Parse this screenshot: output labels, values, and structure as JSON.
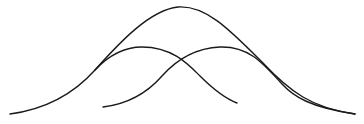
{
  "diagram": {
    "type": "overlapping-bell-curves",
    "stroke_color": "#1a1a1a",
    "background": "#ffffff",
    "curves": [
      {
        "name": "envelope",
        "peak": [
          180,
          7
        ],
        "start": [
          10,
          114
        ],
        "end": [
          355,
          114
        ]
      },
      {
        "name": "left-component",
        "peak": [
          140,
          47
        ],
        "start": [
          10,
          114
        ],
        "end": [
          237,
          103
        ]
      },
      {
        "name": "right-component",
        "peak": [
          220,
          47
        ],
        "start": [
          103,
          107
        ],
        "end": [
          355,
          114
        ]
      }
    ],
    "caption": ""
  }
}
